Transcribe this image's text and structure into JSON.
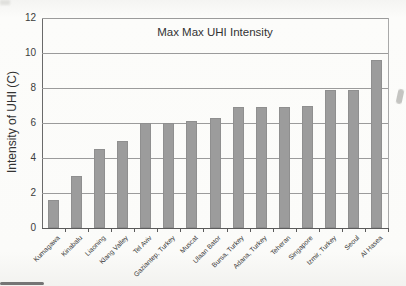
{
  "chart_data": {
    "type": "bar",
    "title": "Max Max UHI Intensity",
    "xlabel": "",
    "ylabel": "Intensity of UHI (C)",
    "categories": [
      "Kumagawa",
      "Kinabalu",
      "Liaoning",
      "Klang Valley",
      "Tel Aviv",
      "Gaziantep, Turkey",
      "Muscat",
      "Ulaan Bator",
      "Bursa, Turkey",
      "Adana, Turkey",
      "Teheran",
      "Singapore",
      "Izmir, Turkey",
      "Seoul",
      "Al Hasea"
    ],
    "values": [
      1.6,
      3.0,
      4.5,
      5.0,
      6.0,
      6.0,
      6.1,
      6.3,
      6.9,
      6.9,
      6.9,
      7.0,
      7.9,
      7.9,
      9.6
    ],
    "ylim": [
      0,
      12
    ],
    "yticks": [
      0,
      2,
      4,
      6,
      8,
      10,
      12
    ],
    "grid": true,
    "legend": "none",
    "bar_color": "#9c9c9c"
  }
}
